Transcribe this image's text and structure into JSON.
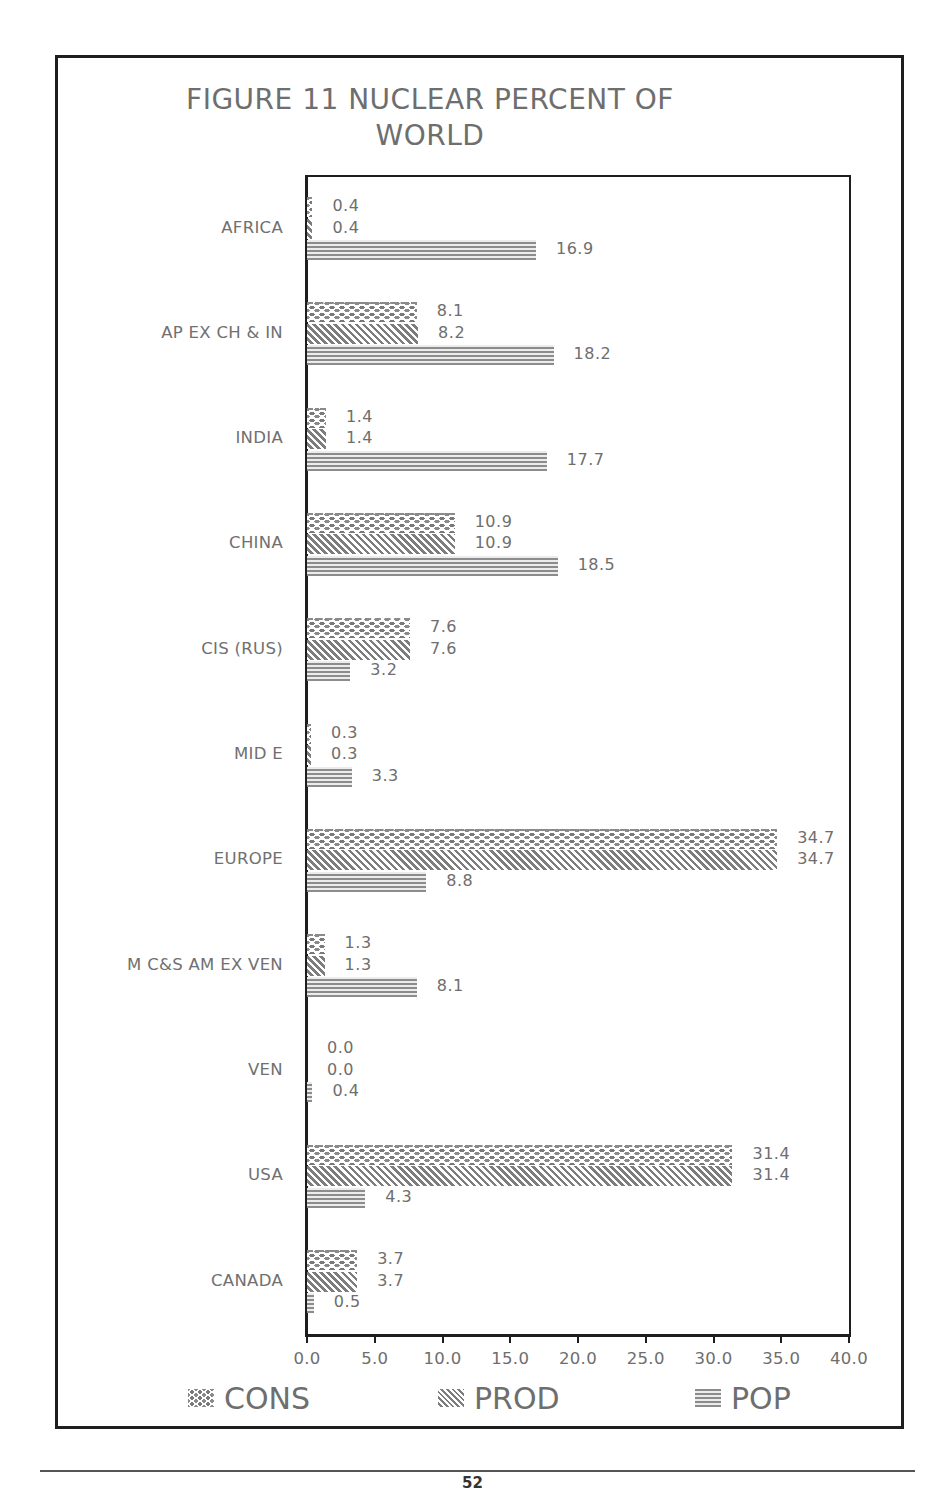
{
  "page": {
    "page_number": "52"
  },
  "chart_data": {
    "type": "bar",
    "orientation": "horizontal",
    "title": "FIGURE 11 NUCLEAR PERCENT OF WORLD",
    "title_lines": [
      "FIGURE 11 NUCLEAR PERCENT OF",
      "WORLD"
    ],
    "xlabel": "",
    "ylabel": "",
    "xlim": [
      0,
      40
    ],
    "x_ticks": [
      "0.0",
      "5.0",
      "10.0",
      "15.0",
      "20.0",
      "25.0",
      "30.0",
      "35.0",
      "40.0"
    ],
    "grid": false,
    "legend_position": "bottom",
    "categories": [
      "AFRICA",
      "AP EX CH & IN",
      "INDIA",
      "CHINA",
      "CIS (RUS)",
      "MID E",
      "EUROPE",
      "M  C&S AM EX VEN",
      "VEN",
      "USA",
      "CANADA"
    ],
    "series": [
      {
        "name": "CONS",
        "pattern": "dots",
        "values": [
          0.4,
          8.1,
          1.4,
          10.9,
          7.6,
          0.3,
          34.7,
          1.3,
          0.0,
          31.4,
          3.7
        ]
      },
      {
        "name": "PROD",
        "pattern": "diagonal",
        "values": [
          0.4,
          8.2,
          1.4,
          10.9,
          7.6,
          0.3,
          34.7,
          1.3,
          0.0,
          31.4,
          3.7
        ]
      },
      {
        "name": "POP",
        "pattern": "horizontal",
        "values": [
          16.9,
          18.2,
          17.7,
          18.5,
          3.2,
          3.3,
          8.8,
          8.1,
          0.4,
          4.3,
          0.5
        ]
      }
    ],
    "value_labels": {
      "CONS": [
        "0.4",
        "8.1",
        "1.4",
        "10.9",
        "7.6",
        "0.3",
        "34.7",
        "1.3",
        "0.0",
        "31.4",
        "3.7"
      ],
      "PROD": [
        "0.4",
        "8.2",
        "1.4",
        "10.9",
        "7.6",
        "0.3",
        "34.7",
        "1.3",
        "0.0",
        "31.4",
        "3.7"
      ],
      "POP": [
        "16.9",
        "18.2",
        "17.7",
        "18.5",
        "3.2",
        "3.3",
        "8.8",
        "8.1",
        "0.4",
        "4.3",
        "0.5"
      ]
    },
    "legend": [
      "CONS",
      "PROD",
      "POP"
    ]
  }
}
